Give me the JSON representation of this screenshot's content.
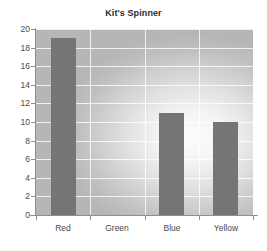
{
  "chart_data": {
    "type": "bar",
    "title": "Kit's Spinner",
    "xlabel": "",
    "ylabel": "",
    "categories": [
      "Red",
      "Green",
      "Blue",
      "Yellow"
    ],
    "values": [
      19,
      0,
      11,
      10
    ],
    "ylim": [
      0,
      20
    ],
    "ytick_labels": [
      "0",
      "2",
      "4",
      "6",
      "8",
      "10",
      "12",
      "14",
      "16",
      "18",
      "20"
    ],
    "ytick_values": [
      0,
      2,
      4,
      6,
      8,
      10,
      12,
      14,
      16,
      18,
      20
    ],
    "grid": true,
    "legend": false,
    "legend_position": "none",
    "bar_color": "#757575",
    "plot_background_center_color": "#fdfdfd",
    "plot_background_edge_color": "#b6b6b6",
    "gridline_color": "#ffffff",
    "axis_color": "#8f8f8f",
    "title_color": "#2b2b2b",
    "tick_label_color": "#4a4a4a"
  }
}
